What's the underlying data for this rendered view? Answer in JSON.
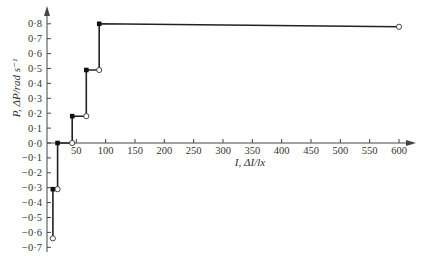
{
  "chart_data": {
    "type": "line",
    "subtype": "step",
    "title": "",
    "xlabel": "I, ΔI/lx",
    "ylabel": "P, ΔP/rad s⁻¹",
    "xlim": [
      0,
      620
    ],
    "ylim": [
      -0.7,
      0.85
    ],
    "grid": false,
    "legend": null,
    "x_ticks": [
      50,
      100,
      150,
      200,
      250,
      300,
      350,
      400,
      450,
      500,
      550,
      600
    ],
    "x_tick_labels": [
      "50",
      "100",
      "150",
      "200",
      "250",
      "300",
      "350",
      "400",
      "450",
      "500",
      "550",
      "600"
    ],
    "y_ticks": [
      0.8,
      0.7,
      0.6,
      0.5,
      0.4,
      0.3,
      0.2,
      0.1,
      0.0,
      -0.1,
      -0.2,
      -0.3,
      -0.4,
      -0.5,
      -0.6,
      -0.7
    ],
    "y_tick_labels": [
      "0·8",
      "0·7",
      "0·6",
      "0·5",
      "0·4",
      "0·3",
      "0·2",
      "0·1",
      "0·0",
      "−0·1",
      "−0·2",
      "−0·3",
      "−0·4",
      "−0·5",
      "−0·6",
      "−0·7"
    ],
    "series": [
      {
        "name": "step response",
        "path": [
          {
            "x": 10,
            "y": -0.64
          },
          {
            "x": 10,
            "y": -0.31
          },
          {
            "x": 18,
            "y": -0.31
          },
          {
            "x": 18,
            "y": 0.0
          },
          {
            "x": 43,
            "y": 0.0
          },
          {
            "x": 43,
            "y": 0.18
          },
          {
            "x": 67,
            "y": 0.18
          },
          {
            "x": 67,
            "y": 0.49
          },
          {
            "x": 89,
            "y": 0.49
          },
          {
            "x": 89,
            "y": 0.8
          },
          {
            "x": 600,
            "y": 0.78
          }
        ],
        "filled_markers": [
          {
            "x": 10,
            "y": -0.31
          },
          {
            "x": 18,
            "y": 0.0
          },
          {
            "x": 43,
            "y": 0.18
          },
          {
            "x": 67,
            "y": 0.49
          },
          {
            "x": 89,
            "y": 0.8
          }
        ],
        "open_markers": [
          {
            "x": 10,
            "y": -0.64
          },
          {
            "x": 18,
            "y": -0.31
          },
          {
            "x": 43,
            "y": 0.0
          },
          {
            "x": 67,
            "y": 0.18
          },
          {
            "x": 89,
            "y": 0.49
          },
          {
            "x": 600,
            "y": 0.78
          }
        ]
      }
    ]
  }
}
